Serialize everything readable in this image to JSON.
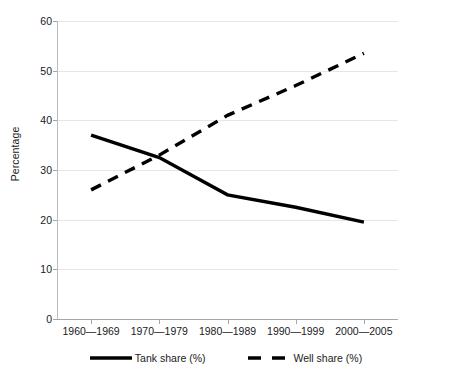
{
  "chart_data": {
    "type": "line",
    "title": "",
    "xlabel": "",
    "ylabel": "Percentage",
    "categories": [
      "1960—1969",
      "1970—1979",
      "1980—1989",
      "1990—1999",
      "2000—2005"
    ],
    "series": [
      {
        "name": "Tank share (%)",
        "style": "solid",
        "color": "#000000",
        "values": [
          37,
          32.5,
          25,
          22.5,
          19.5
        ]
      },
      {
        "name": "Well share (%)",
        "style": "dashed",
        "color": "#000000",
        "values": [
          26,
          33,
          41,
          47,
          53.5
        ]
      }
    ],
    "ylim": [
      0,
      60
    ],
    "y_ticks": [
      0,
      10,
      20,
      30,
      40,
      50,
      60
    ],
    "y_tick_labels": [
      "0",
      "10",
      "20",
      "30",
      "40",
      "50",
      "60"
    ],
    "grid": true,
    "legend_position": "bottom",
    "colors": {
      "gridline": "#e6e6e6",
      "axis": "#a6a6a6",
      "text": "#1a1a1a",
      "background": "#ffffff"
    }
  }
}
